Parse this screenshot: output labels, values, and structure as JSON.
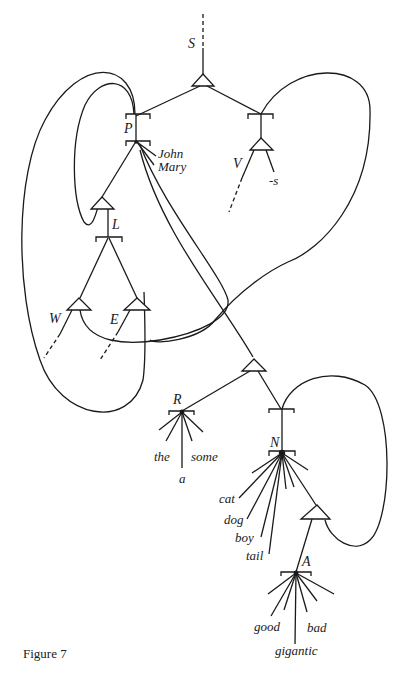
{
  "figure": {
    "caption": "Figure 7",
    "nodes": {
      "S": "S",
      "P": "P",
      "V": "V",
      "L": "L",
      "W": "W",
      "E": "E",
      "R": "R",
      "N": "N",
      "A": "A"
    },
    "leaves": {
      "P": [
        "John",
        "Mary"
      ],
      "V": [
        "-s"
      ],
      "R": [
        "the",
        "a",
        "some"
      ],
      "N": [
        "cat",
        "dog",
        "boy",
        "tail"
      ],
      "A": [
        "good",
        "gigantic",
        "bad"
      ]
    }
  },
  "colors": {
    "ink": "#1a1a1a",
    "background": "#ffffff"
  }
}
